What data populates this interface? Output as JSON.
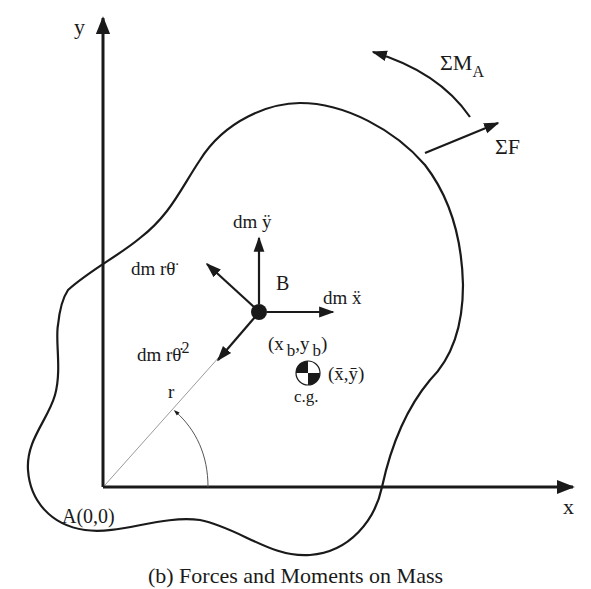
{
  "diagram": {
    "type": "free-body diagram of a rigid body in plane motion",
    "axes": {
      "y_label": "y",
      "x_label": "x",
      "origin_label": "A(0,0)"
    },
    "external_loads": {
      "moment_label": "ΣM",
      "moment_subscript": "A",
      "force_label": "ΣF"
    },
    "point_b": {
      "label": "B",
      "coord_open": "(x",
      "coord_x_sub": "b",
      "coord_comma": ",y",
      "coord_y_sub": "b",
      "coord_close": ")"
    },
    "inertial_forces": {
      "y_accel": "dm ÿ",
      "x_accel": "dm ẍ",
      "tangential": "dm rθ̈",
      "centripetal_base": "dm rθ̇",
      "centripetal_power": "2"
    },
    "geometry": {
      "radius_label": "r",
      "angle_label": "θ"
    },
    "center_of_gravity": {
      "coords": "(x̄,ȳ)",
      "label": "c.g."
    },
    "caption": "(b) Forces and Moments on Mass"
  },
  "colors": {
    "ink": "#1a1a1a",
    "background": "#ffffff",
    "radius_line": "#9a9a9a"
  }
}
